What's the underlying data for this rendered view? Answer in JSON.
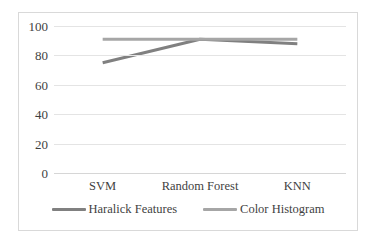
{
  "chart_data": {
    "type": "line",
    "title": "",
    "xlabel": "",
    "ylabel": "",
    "categories": [
      "SVM",
      "Random Forest",
      "KNN"
    ],
    "series": [
      {
        "name": "Haralick Features",
        "values": [
          75,
          91,
          88
        ],
        "color": "#808080"
      },
      {
        "name": "Color Histogram",
        "values": [
          91,
          91,
          91
        ],
        "color": "#a6a6a6"
      }
    ],
    "ylim": [
      0,
      100
    ],
    "yticks": [
      0,
      20,
      40,
      60,
      80,
      100
    ],
    "ytick_labels": [
      "0",
      "20",
      "40",
      "60",
      "80",
      "100"
    ],
    "grid": "horizontal",
    "legend_position": "bottom"
  },
  "frame": {
    "border_color": "#d9d9d9",
    "gridline_color": "#e4e4e4"
  }
}
